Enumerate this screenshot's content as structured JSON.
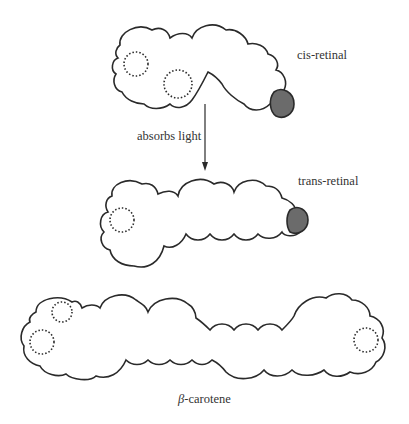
{
  "figure": {
    "molecules": [
      {
        "id": "cis-retinal",
        "label": "cis-retinal",
        "highlight_color": "#6b6b6b"
      },
      {
        "id": "trans-retinal",
        "label": "trans-retinal",
        "highlight_color": "#6b6b6b"
      },
      {
        "id": "beta-carotene",
        "label_symbol": "β",
        "label_text": "-carotene"
      }
    ],
    "arrow": {
      "label": "absorbs light",
      "direction": "down"
    }
  }
}
